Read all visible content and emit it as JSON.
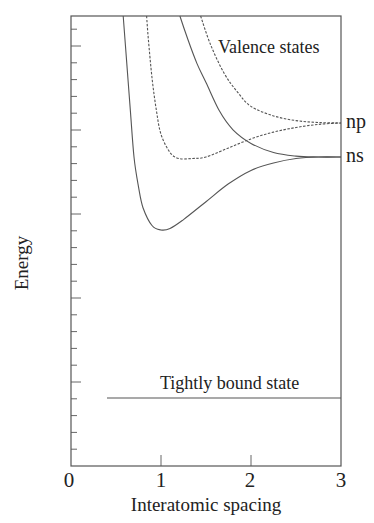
{
  "chart_data": {
    "type": "line",
    "title": "",
    "xlabel": "Interatomic spacing",
    "ylabel": "Energy",
    "xlim": [
      0,
      3
    ],
    "xticks": [
      "0",
      "1",
      "2",
      "3"
    ],
    "ylim": [
      0,
      1
    ],
    "yticks_shown": "minor ticks only, unlabeled",
    "grid": false,
    "legend": null,
    "annotations": {
      "valence": "Valence states",
      "tight": "Tightly bound state",
      "np": "np",
      "ns": "ns"
    },
    "series": [
      {
        "name": "ns bonding",
        "style": "solid",
        "x": [
          0.58,
          0.62,
          0.66,
          0.7,
          0.75,
          0.8,
          0.9,
          1.0,
          1.1,
          1.25,
          1.5,
          1.75,
          2.0,
          2.25,
          2.5,
          2.75,
          3.0
        ],
        "y": [
          1.0,
          0.9,
          0.8,
          0.7,
          0.6,
          0.53,
          0.47,
          0.455,
          0.46,
          0.49,
          0.55,
          0.61,
          0.655,
          0.68,
          0.695,
          0.7,
          0.7
        ]
      },
      {
        "name": "np bonding",
        "style": "dashed",
        "x": [
          0.84,
          0.86,
          0.9,
          0.95,
          1.0,
          1.1,
          1.2,
          1.35,
          1.5,
          1.75,
          2.0,
          2.25,
          2.5,
          2.75,
          3.0
        ],
        "y": [
          1.0,
          0.95,
          0.87,
          0.8,
          0.75,
          0.71,
          0.695,
          0.695,
          0.7,
          0.72,
          0.74,
          0.755,
          0.765,
          0.772,
          0.775
        ]
      },
      {
        "name": "ns antibonding",
        "style": "solid",
        "x": [
          1.21,
          1.3,
          1.4,
          1.5,
          1.65,
          1.8,
          2.0,
          2.25,
          2.5,
          2.75,
          3.0
        ],
        "y": [
          1.0,
          0.95,
          0.9,
          0.86,
          0.8,
          0.76,
          0.73,
          0.71,
          0.702,
          0.7,
          0.7
        ]
      },
      {
        "name": "np antibonding",
        "style": "dashed",
        "x": [
          1.44,
          1.55,
          1.7,
          1.85,
          2.0,
          2.25,
          2.5,
          2.75,
          3.0
        ],
        "y": [
          1.0,
          0.94,
          0.88,
          0.84,
          0.81,
          0.79,
          0.78,
          0.776,
          0.775
        ]
      },
      {
        "name": "Tightly bound state",
        "style": "solid",
        "x": [
          0.4,
          3.0
        ],
        "y": [
          0.15,
          0.15
        ]
      }
    ]
  }
}
